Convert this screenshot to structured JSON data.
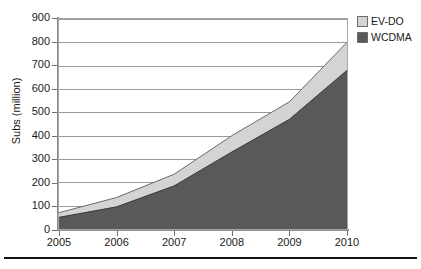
{
  "chart_data": {
    "type": "area",
    "stacked": true,
    "title": "",
    "xlabel": "",
    "ylabel": "Subs (million)",
    "x": [
      2005,
      2006,
      2007,
      2008,
      2009,
      2010
    ],
    "categories": [
      "2005",
      "2006",
      "2007",
      "2008",
      "2009",
      "2010"
    ],
    "xlim": [
      2005,
      2010
    ],
    "ylim": [
      0,
      900
    ],
    "ytick_step": 100,
    "yticks": [
      0,
      100,
      200,
      300,
      400,
      500,
      600,
      700,
      800,
      900
    ],
    "ytick_labels": [
      "0",
      "100",
      "200",
      "300",
      "400",
      "500",
      "600",
      "700",
      "800",
      "900"
    ],
    "xtick_labels": [
      "2005",
      "2006",
      "2007",
      "2008",
      "2009",
      "2010"
    ],
    "grid": true,
    "grid_axis": "y",
    "legend_position": "top-right",
    "series": [
      {
        "name": "EV-DO",
        "color": "#d4d4d4",
        "values": [
          20,
          40,
          50,
          70,
          75,
          120
        ]
      },
      {
        "name": "WCDMA",
        "color": "#595959",
        "values": [
          50,
          95,
          185,
          330,
          470,
          680
        ]
      }
    ],
    "stack_totals": [
      70,
      135,
      235,
      400,
      545,
      800
    ],
    "annotations": []
  },
  "legend": {
    "items": [
      {
        "label": "EV-DO",
        "color": "#d4d4d4"
      },
      {
        "label": "WCDMA",
        "color": "#595959"
      }
    ]
  },
  "colors": {
    "evdo": "#d4d4d4",
    "wcdma": "#595959",
    "grid": "#9a9a9a",
    "axis": "#8c8c8c",
    "rule": "#111111",
    "background": "#ffffff"
  }
}
